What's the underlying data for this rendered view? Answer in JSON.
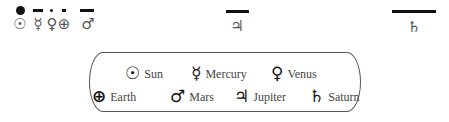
{
  "top_row": [
    {
      "name": "sun",
      "marker": "dot",
      "symbol": "☉",
      "x": 20
    },
    {
      "name": "mercury",
      "marker": "dash",
      "symbol": "☿",
      "x": 38
    },
    {
      "name": "venus",
      "marker": "small-dot",
      "symbol": "♀",
      "x": 52
    },
    {
      "name": "earth",
      "marker": "small-dash",
      "symbol": "⊕",
      "x": 64
    },
    {
      "name": "mars",
      "marker": "dash",
      "symbol": "♂",
      "x": 88
    },
    {
      "name": "jupiter",
      "marker": "long-dash",
      "symbol": "♃",
      "x": 237
    },
    {
      "name": "saturn",
      "marker": "longest-dash",
      "symbol": "♄",
      "x": 414
    }
  ],
  "legend": {
    "row1": [
      {
        "symbol": "☉",
        "label": "Sun"
      },
      {
        "symbol": "☿",
        "label": "Mercury"
      },
      {
        "symbol": "♀",
        "label": "Venus"
      }
    ],
    "row2": [
      {
        "symbol": "⊕",
        "label": "Earth"
      },
      {
        "symbol": "♂",
        "label": "Mars"
      },
      {
        "symbol": "♃",
        "label": "Jupiter"
      },
      {
        "symbol": "♄",
        "label": "Saturn"
      }
    ]
  }
}
